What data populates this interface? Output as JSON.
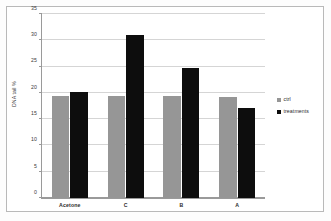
{
  "chart_data": {
    "type": "bar",
    "title": "",
    "subtitle": "",
    "xlabel": "",
    "ylabel": "DNA tail %",
    "categories": [
      "Acetone",
      "C",
      "B",
      "A"
    ],
    "series": [
      {
        "name": "ctrl",
        "color": "#969696",
        "values": [
          19.5,
          19.5,
          19.4,
          19.3
        ]
      },
      {
        "name": "treatments",
        "color": "#0d0d0d",
        "values": [
          20.2,
          31.0,
          24.8,
          17.1
        ]
      }
    ],
    "ylim": [
      0,
      35
    ],
    "ytick_step": 5,
    "yticks": [
      0,
      5,
      10,
      15,
      20,
      25,
      30,
      35
    ],
    "ytick_labels": [
      "0",
      "5",
      "10",
      "15",
      "20",
      "25",
      "30",
      "35"
    ],
    "grid": true,
    "grid_axis": "y",
    "legend_position": "right",
    "legend": [
      "ctrl",
      "treatments"
    ],
    "annotations": []
  },
  "legend": {
    "items": [
      {
        "label": "ctrl",
        "color": "#969696"
      },
      {
        "label": "treatments",
        "color": "#0d0d0d"
      }
    ]
  },
  "colors": {
    "ctrl": "#969696",
    "treatments": "#0d0d0d",
    "gridline": "#d5d5d5",
    "axis": "#9a9a9a",
    "frame": "#b9b9b9",
    "background": "#ffffff"
  }
}
